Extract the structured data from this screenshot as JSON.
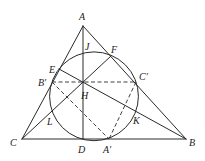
{
  "diagram": {
    "type": "geometry",
    "points": {
      "A": {
        "label": "A",
        "x": 83,
        "y": 26,
        "lx": 79,
        "ly": 20
      },
      "B": {
        "label": "B",
        "x": 186,
        "y": 139,
        "lx": 189,
        "ly": 146
      },
      "C": {
        "label": "C",
        "x": 22,
        "y": 139,
        "lx": 10,
        "ly": 146
      },
      "D": {
        "label": "D",
        "x": 83,
        "y": 139,
        "lx": 78,
        "ly": 153
      },
      "E": {
        "label": "E",
        "x": 59,
        "y": 69,
        "lx": 49,
        "ly": 73
      },
      "F": {
        "label": "F",
        "x": 111,
        "y": 56,
        "lx": 111,
        "ly": 53
      },
      "H": {
        "label": "H",
        "x": 83,
        "y": 82,
        "lx": 81,
        "ly": 99
      },
      "J": {
        "label": "J",
        "x": 83,
        "y": 52,
        "lx": 85,
        "ly": 50
      },
      "K": {
        "label": "K",
        "x": 135,
        "y": 109,
        "lx": 133,
        "ly": 124
      },
      "L": {
        "label": "L",
        "x": 52,
        "y": 111,
        "lx": 47,
        "ly": 125
      },
      "A'": {
        "label": "A′",
        "x": 109,
        "y": 139,
        "lx": 103,
        "ly": 153
      },
      "B'": {
        "label": "B′",
        "x": 52,
        "y": 82,
        "lx": 38,
        "ly": 86
      },
      "C'": {
        "label": "C′",
        "x": 136,
        "y": 82,
        "lx": 139,
        "ly": 80
      }
    },
    "circle": {
      "cx": 94,
      "cy": 96.3,
      "r": 44.4
    },
    "solid_segments": [
      [
        "A",
        "B"
      ],
      [
        "A",
        "C"
      ],
      [
        "C",
        "B"
      ],
      [
        "A",
        "D"
      ],
      [
        "C",
        "F"
      ],
      [
        "B",
        "E"
      ]
    ],
    "dashed_segments": [
      [
        "B'",
        "C'"
      ],
      [
        "B'",
        "A'"
      ],
      [
        "C'",
        "A'"
      ]
    ]
  }
}
